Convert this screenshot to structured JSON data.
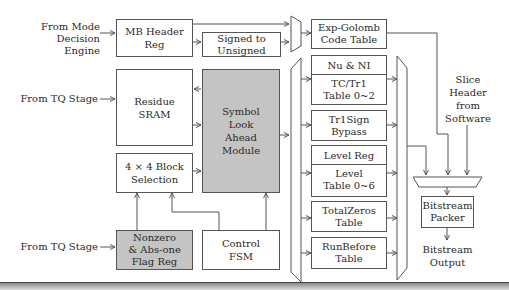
{
  "inputs": {
    "mode_decision": [
      "From Mode",
      "Decision Engine"
    ],
    "tq_stage_1": "From TQ Stage",
    "tq_stage_2": "From TQ Stage",
    "slice_header": [
      "Slice",
      "Header",
      "from",
      "Software"
    ]
  },
  "blocks": {
    "mb_header_reg": [
      "MB Header",
      "Reg"
    ],
    "signed_to_unsigned": [
      "Signed to",
      "Unsigned"
    ],
    "residue_sram": [
      "Residue",
      "SRAM"
    ],
    "symbol_look_ahead": [
      "Symbol",
      "Look",
      "Ahead",
      "Module"
    ],
    "block_selection": [
      "4 × 4 Block",
      "Selection"
    ],
    "nonzero_flag_reg": [
      "Nonzero",
      "& Abs-one",
      "Flag Reg"
    ],
    "control_fsm": [
      "Control",
      "FSM"
    ],
    "exp_golomb": [
      "Exp-Golomb",
      "Code Table"
    ],
    "nu_ni": "Nu & NI",
    "tc_tr1": [
      "TC/Tr1",
      "Table 0~2"
    ],
    "tr1sign": [
      "Tr1Sign",
      "Bypass"
    ],
    "level_reg": "Level Reg",
    "level_table": [
      "Level",
      "Table 0~6"
    ],
    "total_zeros": [
      "TotalZeros",
      "Table"
    ],
    "run_before": [
      "RunBefore",
      "Table"
    ],
    "bitstream_packer": [
      "Bitstream",
      "Packer"
    ]
  },
  "outputs": {
    "bitstream_output": [
      "Bitstream",
      "Output"
    ]
  },
  "colors": {
    "highlight_fill": "#c4c4c4",
    "line": "#555555"
  }
}
